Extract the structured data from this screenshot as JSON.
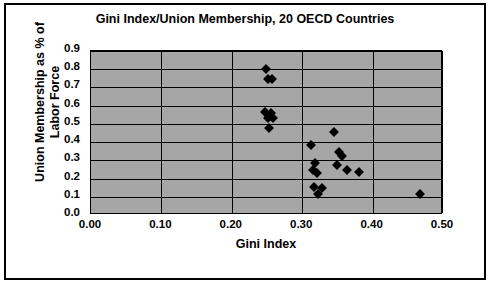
{
  "chart_data": {
    "type": "scatter",
    "title": "Gini Index/Union Membership, 20 OECD Countries",
    "xlabel": "Gini Index",
    "ylabel": "Union Membership as % of Labor Force",
    "xlim": [
      0.0,
      0.5
    ],
    "ylim": [
      0.0,
      0.9
    ],
    "xticks": [
      "0.00",
      "0.10",
      "0.20",
      "0.30",
      "0.40",
      "0.50"
    ],
    "yticks": [
      "0.0",
      "0.1",
      "0.2",
      "0.3",
      "0.4",
      "0.5",
      "0.6",
      "0.7",
      "0.8",
      "0.9"
    ],
    "grid": true,
    "legend": false,
    "plot_background": "#a6a6a6",
    "marker_color": "#000000",
    "marker_shape": "diamond",
    "points": [
      {
        "x": 0.249,
        "y": 0.8
      },
      {
        "x": 0.251,
        "y": 0.745
      },
      {
        "x": 0.257,
        "y": 0.745
      },
      {
        "x": 0.247,
        "y": 0.565
      },
      {
        "x": 0.256,
        "y": 0.56
      },
      {
        "x": 0.252,
        "y": 0.535
      },
      {
        "x": 0.258,
        "y": 0.53
      },
      {
        "x": 0.253,
        "y": 0.475
      },
      {
        "x": 0.345,
        "y": 0.455
      },
      {
        "x": 0.313,
        "y": 0.385
      },
      {
        "x": 0.352,
        "y": 0.345
      },
      {
        "x": 0.357,
        "y": 0.325
      },
      {
        "x": 0.318,
        "y": 0.285
      },
      {
        "x": 0.349,
        "y": 0.275
      },
      {
        "x": 0.315,
        "y": 0.245
      },
      {
        "x": 0.363,
        "y": 0.245
      },
      {
        "x": 0.321,
        "y": 0.23
      },
      {
        "x": 0.381,
        "y": 0.235
      },
      {
        "x": 0.317,
        "y": 0.155
      },
      {
        "x": 0.328,
        "y": 0.15
      },
      {
        "x": 0.322,
        "y": 0.115
      },
      {
        "x": 0.467,
        "y": 0.115
      }
    ]
  }
}
